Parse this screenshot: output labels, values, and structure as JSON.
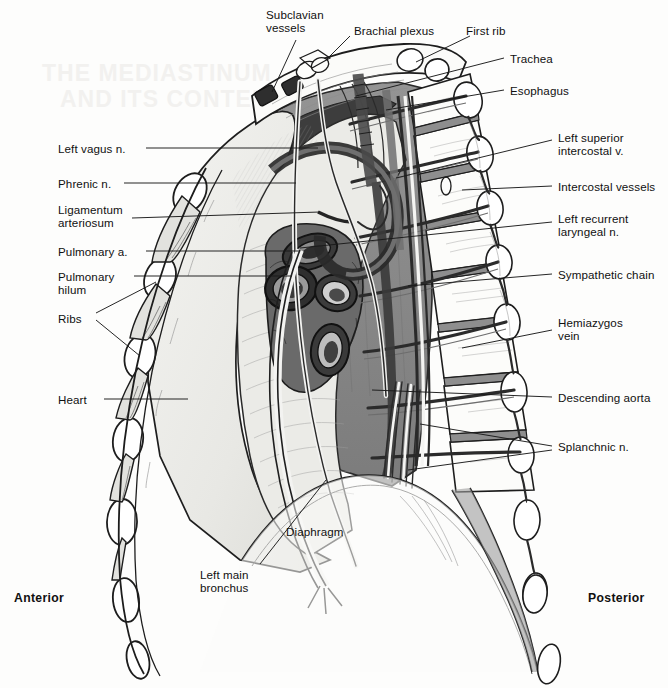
{
  "figure": {
    "caption": "",
    "orientation": {
      "anterior": "Anterior",
      "posterior": "Posterior"
    },
    "colors": {
      "ink": "#101010",
      "leader_line": "#1a1a1a",
      "lung": "#ededea",
      "mediastinal_fat": "#8a8a8a",
      "vessel_dark": "#4a4a4a",
      "bone_light": "#fbfbf9",
      "paper": "#fdfdfc"
    }
  },
  "labels_left": [
    {
      "text": "Left vagus n.",
      "x": 58,
      "y": 142,
      "lines": 1
    },
    {
      "text": "Phrenic n.",
      "x": 58,
      "y": 177,
      "lines": 1
    },
    {
      "text": "Ligamentum\narteriosum",
      "x": 58,
      "y": 203,
      "lines": 2
    },
    {
      "text": "Pulmonary a.",
      "x": 58,
      "y": 245,
      "lines": 1
    },
    {
      "text": "Pulmonary\nhilum",
      "x": 58,
      "y": 270,
      "lines": 2
    },
    {
      "text": "Ribs",
      "x": 58,
      "y": 312,
      "lines": 1
    },
    {
      "text": "Heart",
      "x": 58,
      "y": 393,
      "lines": 1
    }
  ],
  "labels_top": [
    {
      "text": "Subclavian\nvessels",
      "x": 266,
      "y": 8,
      "lines": 2
    },
    {
      "text": "Brachial plexus",
      "x": 354,
      "y": 24,
      "lines": 1
    },
    {
      "text": "First rib",
      "x": 466,
      "y": 24,
      "lines": 1
    }
  ],
  "labels_right": [
    {
      "text": "Trachea",
      "x": 510,
      "y": 52,
      "lines": 1
    },
    {
      "text": "Esophagus",
      "x": 510,
      "y": 84,
      "lines": 1
    },
    {
      "text": "Left superior\nintercostal v.",
      "x": 558,
      "y": 131,
      "lines": 2
    },
    {
      "text": "Intercostal vessels",
      "x": 558,
      "y": 180,
      "lines": 1
    },
    {
      "text": "Left recurrent\nlaryngeal n.",
      "x": 558,
      "y": 212,
      "lines": 2
    },
    {
      "text": "Sympathetic chain",
      "x": 558,
      "y": 268,
      "lines": 1
    },
    {
      "text": "Hemiazygos\nvein",
      "x": 558,
      "y": 316,
      "lines": 2
    },
    {
      "text": "Descending aorta",
      "x": 558,
      "y": 391,
      "lines": 1
    },
    {
      "text": "Splanchnic n.",
      "x": 558,
      "y": 440,
      "lines": 1
    }
  ],
  "labels_bottom": [
    {
      "text": "Diaphragm",
      "x": 286,
      "y": 525,
      "lines": 1
    },
    {
      "text": "Left main\nbronchus",
      "x": 200,
      "y": 568,
      "lines": 2
    }
  ]
}
